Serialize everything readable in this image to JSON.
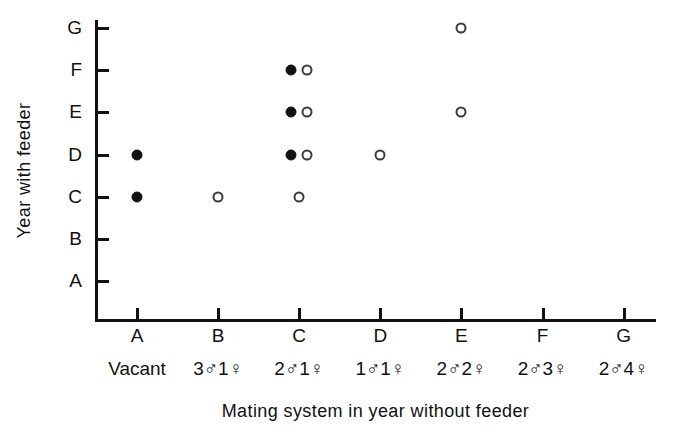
{
  "chart_data": {
    "type": "scatter",
    "title": "",
    "xlabel": "Mating system in year without feeder",
    "ylabel": "Year with feeder",
    "grid": false,
    "legend": "none",
    "x_categories": [
      "A",
      "B",
      "C",
      "D",
      "E",
      "F",
      "G"
    ],
    "y_categories": [
      "A",
      "B",
      "C",
      "D",
      "E",
      "F",
      "G"
    ],
    "x_category_descriptions": [
      "Vacant",
      "3♂1♀",
      "2♂1♀",
      "1♂1♀",
      "2♂2♀",
      "2♂3♀",
      "2♂4♀"
    ],
    "x_sublabels": [
      {
        "text": "Vacant",
        "males": null,
        "females": null
      },
      {
        "text": "3♂1♀",
        "males": 3,
        "females": 1
      },
      {
        "text": "2♂1♀",
        "males": 2,
        "females": 1
      },
      {
        "text": "1♂1♀",
        "males": 1,
        "females": 1
      },
      {
        "text": "2♂2♀",
        "males": 2,
        "females": 2
      },
      {
        "text": "2♂3♀",
        "males": 2,
        "females": 3
      },
      {
        "text": "2♂4♀",
        "males": 2,
        "females": 4
      }
    ],
    "series": [
      {
        "name": "filled",
        "marker": "filled-circle",
        "color": "#111111",
        "points": [
          {
            "x": "A",
            "y": "D"
          },
          {
            "x": "A",
            "y": "C"
          },
          {
            "x": "C",
            "y": "F"
          },
          {
            "x": "C",
            "y": "E"
          },
          {
            "x": "C",
            "y": "D"
          }
        ]
      },
      {
        "name": "open",
        "marker": "open-circle",
        "color": "#3a3a40",
        "points": [
          {
            "x": "B",
            "y": "C"
          },
          {
            "x": "C",
            "y": "F"
          },
          {
            "x": "C",
            "y": "E"
          },
          {
            "x": "C",
            "y": "D"
          },
          {
            "x": "C",
            "y": "C"
          },
          {
            "x": "D",
            "y": "D"
          },
          {
            "x": "E",
            "y": "G"
          },
          {
            "x": "E",
            "y": "E"
          }
        ]
      }
    ]
  },
  "axes": {
    "y_title": "Year with feeder",
    "x_title": "Mating system in year without feeder"
  }
}
